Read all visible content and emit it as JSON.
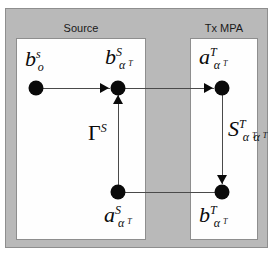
{
  "diagram": {
    "background_color": "#b9b9b9",
    "panel_color": "#fefefe",
    "node_color": "#0a0a0a",
    "line_color": "#4a4a4a"
  },
  "panels": [
    {
      "id": "source",
      "caption": "Source"
    },
    {
      "id": "tx_mpa",
      "caption": "Tx MPA"
    }
  ],
  "nodes": [
    {
      "id": "b_o_s",
      "panel": "source",
      "base": "b",
      "sup": "s",
      "sub": "o",
      "sub2": "",
      "x": 36,
      "y": 88
    },
    {
      "id": "b_aT_S",
      "panel": "source",
      "base": "b",
      "sup": "S",
      "sub": "α",
      "sub2": "T",
      "x": 118,
      "y": 88
    },
    {
      "id": "a_aT_S",
      "panel": "source",
      "base": "a",
      "sup": "S",
      "sub": "α",
      "sub2": "T",
      "x": 118,
      "y": 192
    },
    {
      "id": "a_aT_T",
      "panel": "tx_mpa",
      "base": "a",
      "sup": "T",
      "sub": "α",
      "sub2": "T",
      "x": 222,
      "y": 88
    },
    {
      "id": "b_aT_T",
      "panel": "tx_mpa",
      "base": "b",
      "sup": "T",
      "sub": "α",
      "sub2": "T",
      "x": 222,
      "y": 192
    }
  ],
  "edge_labels": {
    "gamma_source": {
      "base": "Γ",
      "sup": "S",
      "sub": "",
      "sub2": ""
    },
    "s_param_tx": {
      "base": "S",
      "sup": "T",
      "sub": "α",
      "sub2": "T",
      "sub3": "α",
      "sub4": "T"
    }
  },
  "edges": [
    {
      "id": "b_o_to_b_aT_S",
      "from": "b_o_s",
      "to": "b_aT_S",
      "direction": "right"
    },
    {
      "id": "a_aT_S_to_b_aT_S",
      "from": "a_aT_S",
      "to": "b_aT_S",
      "direction": "up",
      "label": "gamma_source"
    },
    {
      "id": "b_aT_S_to_a_aT_T",
      "from": "b_aT_S",
      "to": "a_aT_T",
      "direction": "right"
    },
    {
      "id": "a_aT_T_to_b_aT_T",
      "from": "a_aT_T",
      "to": "b_aT_T",
      "direction": "down",
      "label": "s_param_tx"
    },
    {
      "id": "b_aT_T_to_a_aT_S",
      "from": "b_aT_T",
      "to": "a_aT_S",
      "direction": "left"
    }
  ]
}
